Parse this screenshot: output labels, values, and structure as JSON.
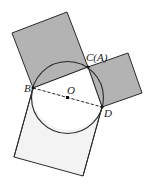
{
  "diagram": {
    "type": "geometry",
    "colors": {
      "shaded_square": "#b3b3b3",
      "light_square": "#f3f3f3",
      "stroke": "#2a2a2a",
      "background": "#ffffff"
    },
    "points": {
      "B": {
        "label": "B",
        "x": 33,
        "y": 88
      },
      "C": {
        "label": "C(A)",
        "x": 88,
        "y": 67
      },
      "D": {
        "label": "D",
        "x": 102,
        "y": 107
      },
      "O": {
        "label": "O",
        "x": 67.5,
        "y": 97.5
      }
    },
    "labels": {
      "B": "B",
      "C": "C(A)",
      "D": "D",
      "O": "O"
    },
    "circle": {
      "cx": 67.5,
      "cy": 97.5,
      "r": 36
    },
    "squares": [
      {
        "name": "square-on-BC",
        "shaded": true
      },
      {
        "name": "square-on-CD",
        "shaded": true
      },
      {
        "name": "square-on-BD",
        "shaded": false
      }
    ],
    "diameter_style": "dashed"
  }
}
